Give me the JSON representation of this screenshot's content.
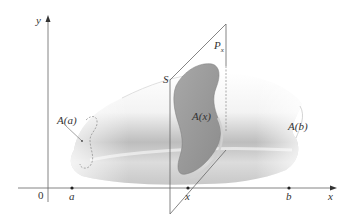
{
  "figure": {
    "axes": {
      "x_label": "x",
      "y_label": "y",
      "origin_label": "0"
    },
    "points": [
      {
        "id": "a",
        "label": "a"
      },
      {
        "id": "x",
        "label": "x"
      },
      {
        "id": "b",
        "label": "b"
      }
    ],
    "labels": {
      "solid": "S",
      "plane": "P",
      "plane_subscript": "x",
      "cross_section_left": "A(a)",
      "cross_section_mid": "A(x)",
      "cross_section_right": "A(b)"
    },
    "colors": {
      "axis": "#555555",
      "plane_edge": "#666666",
      "cross_section_fill": "#9a9a9a",
      "solid_shade": "#b8b8b8"
    }
  }
}
